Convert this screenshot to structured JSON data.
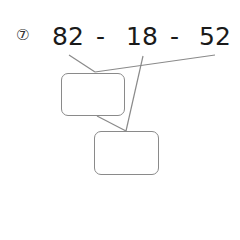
{
  "problem": {
    "number_label": "⑦",
    "terms": [
      "82",
      "18",
      "52"
    ],
    "operators": [
      "-",
      "-"
    ]
  },
  "answer_boxes": [
    {
      "id": "box1",
      "value": ""
    },
    {
      "id": "box2",
      "value": ""
    }
  ],
  "colors": {
    "text": "#1a1a1a",
    "lines": "#8a8a8a"
  }
}
